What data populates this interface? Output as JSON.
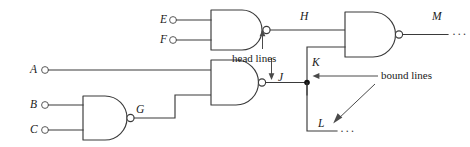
{
  "diagram": {
    "type": "logic-circuit",
    "colors": {
      "stroke": "#3a3a3a",
      "annotation": "#4a4a4a",
      "junction": "#111111",
      "background": "#ffffff"
    }
  },
  "inputs": [
    {
      "id": "E",
      "label": "E",
      "x": 160,
      "y": 20
    },
    {
      "id": "F",
      "label": "F",
      "x": 160,
      "y": 40
    },
    {
      "id": "A",
      "label": "A",
      "x": 30,
      "y": 70
    },
    {
      "id": "B",
      "label": "B",
      "x": 30,
      "y": 105
    },
    {
      "id": "C",
      "label": "C",
      "x": 30,
      "y": 130
    }
  ],
  "signals": [
    {
      "id": "H",
      "label": "H",
      "x": 300,
      "y": 14
    },
    {
      "id": "M",
      "label": "M",
      "x": 432,
      "y": 14
    },
    {
      "id": "G",
      "label": "G",
      "x": 134,
      "y": 108
    },
    {
      "id": "J",
      "label": "J",
      "x": 285,
      "y": 78
    },
    {
      "id": "K",
      "label": "K",
      "x": 313,
      "y": 62
    },
    {
      "id": "L",
      "label": "L",
      "x": 320,
      "y": 122
    }
  ],
  "gates": [
    {
      "id": "gate-ef",
      "type": "NAND",
      "inputs": [
        "E",
        "F"
      ],
      "output": "H"
    },
    {
      "id": "gate-bc",
      "type": "NAND",
      "inputs": [
        "B",
        "C"
      ],
      "output": "G"
    },
    {
      "id": "gate-ag",
      "type": "NAND",
      "inputs": [
        "A",
        "G"
      ],
      "output": "J"
    },
    {
      "id": "gate-m",
      "type": "NAND",
      "inputs": [
        "H",
        "K"
      ],
      "output": "M"
    }
  ],
  "annotations": [
    {
      "id": "head-lines",
      "text": "head lines",
      "x": 232,
      "y": 52
    },
    {
      "id": "bound-lines",
      "text": "bound lines",
      "x": 381,
      "y": 72
    }
  ],
  "ellipses": [
    {
      "id": "ellipsis-m",
      "text": "···",
      "x": 452,
      "y": 27
    },
    {
      "id": "ellipsis-l",
      "text": "···",
      "x": 340,
      "y": 133
    }
  ]
}
